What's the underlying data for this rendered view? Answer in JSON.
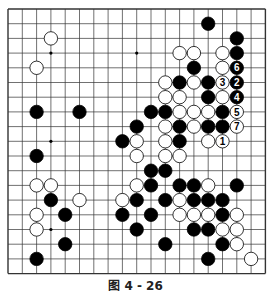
{
  "board": {
    "size": 19,
    "origin_x": 8,
    "origin_y": 9,
    "step_x": 14.3,
    "step_y": 14.7,
    "stone_radius": 6.7,
    "line_color": "#333333",
    "black_color": "#000000",
    "white_color": "#ffffff",
    "hoshi": [
      [
        3,
        3
      ],
      [
        9,
        3
      ],
      [
        15,
        3
      ],
      [
        3,
        9
      ],
      [
        9,
        9
      ],
      [
        15,
        9
      ],
      [
        3,
        15
      ],
      [
        9,
        15
      ],
      [
        15,
        15
      ]
    ],
    "stones": [
      {
        "c": 3,
        "r": 2,
        "color": "W"
      },
      {
        "c": 2,
        "r": 4,
        "color": "W"
      },
      {
        "c": 2,
        "r": 7,
        "color": "B"
      },
      {
        "c": 5,
        "r": 7,
        "color": "B"
      },
      {
        "c": 2,
        "r": 10,
        "color": "B"
      },
      {
        "c": 2,
        "r": 12,
        "color": "W"
      },
      {
        "c": 3,
        "r": 12,
        "color": "W"
      },
      {
        "c": 3,
        "r": 13,
        "color": "B"
      },
      {
        "c": 5,
        "r": 13,
        "color": "W"
      },
      {
        "c": 2,
        "r": 14,
        "color": "W"
      },
      {
        "c": 4,
        "r": 14,
        "color": "B"
      },
      {
        "c": 2,
        "r": 15,
        "color": "W"
      },
      {
        "c": 4,
        "r": 16,
        "color": "B"
      },
      {
        "c": 2,
        "r": 17,
        "color": "B"
      },
      {
        "c": 14,
        "r": 1,
        "color": "B"
      },
      {
        "c": 16,
        "r": 2,
        "color": "B"
      },
      {
        "c": 12,
        "r": 3,
        "color": "W"
      },
      {
        "c": 13,
        "r": 3,
        "color": "W"
      },
      {
        "c": 15,
        "r": 3,
        "color": "W"
      },
      {
        "c": 16,
        "r": 3,
        "color": "B"
      },
      {
        "c": 13,
        "r": 4,
        "color": "B"
      },
      {
        "c": 15,
        "r": 4,
        "color": "W"
      },
      {
        "c": 16,
        "r": 4,
        "color": "B",
        "label": "6"
      },
      {
        "c": 11,
        "r": 5,
        "color": "W"
      },
      {
        "c": 12,
        "r": 5,
        "color": "B"
      },
      {
        "c": 13,
        "r": 5,
        "color": "W"
      },
      {
        "c": 14,
        "r": 5,
        "color": "B"
      },
      {
        "c": 15,
        "r": 5,
        "color": "W",
        "label": "3"
      },
      {
        "c": 16,
        "r": 5,
        "color": "B",
        "label": "2"
      },
      {
        "c": 11,
        "r": 6,
        "color": "W"
      },
      {
        "c": 12,
        "r": 6,
        "color": "W"
      },
      {
        "c": 14,
        "r": 6,
        "color": "B"
      },
      {
        "c": 15,
        "r": 6,
        "color": "W"
      },
      {
        "c": 16,
        "r": 6,
        "color": "B",
        "label": "4"
      },
      {
        "c": 10,
        "r": 7,
        "color": "B"
      },
      {
        "c": 11,
        "r": 7,
        "color": "B"
      },
      {
        "c": 12,
        "r": 7,
        "color": "W"
      },
      {
        "c": 13,
        "r": 7,
        "color": "W"
      },
      {
        "c": 14,
        "r": 7,
        "color": "W"
      },
      {
        "c": 15,
        "r": 7,
        "color": "B"
      },
      {
        "c": 16,
        "r": 7,
        "color": "W",
        "label": "5"
      },
      {
        "c": 9,
        "r": 8,
        "color": "B"
      },
      {
        "c": 11,
        "r": 8,
        "color": "W"
      },
      {
        "c": 12,
        "r": 8,
        "color": "B"
      },
      {
        "c": 13,
        "r": 8,
        "color": "W"
      },
      {
        "c": 14,
        "r": 8,
        "color": "B"
      },
      {
        "c": 15,
        "r": 8,
        "color": "B"
      },
      {
        "c": 16,
        "r": 8,
        "color": "W",
        "label": "7"
      },
      {
        "c": 8,
        "r": 9,
        "color": "B"
      },
      {
        "c": 9,
        "r": 9,
        "color": "W"
      },
      {
        "c": 11,
        "r": 9,
        "color": "W"
      },
      {
        "c": 12,
        "r": 9,
        "color": "B"
      },
      {
        "c": 14,
        "r": 9,
        "color": "W"
      },
      {
        "c": 15,
        "r": 9,
        "color": "W",
        "label": "1"
      },
      {
        "c": 9,
        "r": 10,
        "color": "W"
      },
      {
        "c": 11,
        "r": 10,
        "color": "W"
      },
      {
        "c": 12,
        "r": 10,
        "color": "W"
      },
      {
        "c": 10,
        "r": 11,
        "color": "B"
      },
      {
        "c": 11,
        "r": 11,
        "color": "B"
      },
      {
        "c": 9,
        "r": 12,
        "color": "W"
      },
      {
        "c": 10,
        "r": 12,
        "color": "B"
      },
      {
        "c": 12,
        "r": 12,
        "color": "B"
      },
      {
        "c": 13,
        "r": 12,
        "color": "B"
      },
      {
        "c": 14,
        "r": 12,
        "color": "W"
      },
      {
        "c": 16,
        "r": 12,
        "color": "B"
      },
      {
        "c": 8,
        "r": 13,
        "color": "W"
      },
      {
        "c": 9,
        "r": 13,
        "color": "B"
      },
      {
        "c": 11,
        "r": 13,
        "color": "B"
      },
      {
        "c": 12,
        "r": 13,
        "color": "W"
      },
      {
        "c": 13,
        "r": 13,
        "color": "B"
      },
      {
        "c": 14,
        "r": 13,
        "color": "B"
      },
      {
        "c": 15,
        "r": 13,
        "color": "B"
      },
      {
        "c": 8,
        "r": 14,
        "color": "B"
      },
      {
        "c": 10,
        "r": 14,
        "color": "B"
      },
      {
        "c": 12,
        "r": 14,
        "color": "W"
      },
      {
        "c": 13,
        "r": 14,
        "color": "W"
      },
      {
        "c": 14,
        "r": 14,
        "color": "W"
      },
      {
        "c": 15,
        "r": 14,
        "color": "B"
      },
      {
        "c": 16,
        "r": 14,
        "color": "W"
      },
      {
        "c": 9,
        "r": 15,
        "color": "B"
      },
      {
        "c": 13,
        "r": 15,
        "color": "B"
      },
      {
        "c": 14,
        "r": 15,
        "color": "B"
      },
      {
        "c": 15,
        "r": 15,
        "color": "W"
      },
      {
        "c": 16,
        "r": 15,
        "color": "W"
      },
      {
        "c": 11,
        "r": 16,
        "color": "B"
      },
      {
        "c": 15,
        "r": 16,
        "color": "B"
      },
      {
        "c": 16,
        "r": 16,
        "color": "W"
      },
      {
        "c": 14,
        "r": 17,
        "color": "B"
      },
      {
        "c": 17,
        "r": 17,
        "color": "W"
      }
    ]
  },
  "caption": "图 4 - 26"
}
